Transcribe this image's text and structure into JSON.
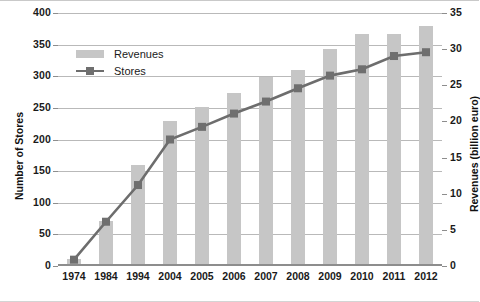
{
  "chart_data": {
    "type": "bar",
    "title": "",
    "subtitle": "",
    "categories": [
      "1974",
      "1984",
      "1994",
      "2004",
      "2005",
      "2006",
      "2007",
      "2008",
      "2009",
      "2010",
      "2011",
      "2012"
    ],
    "xlabel": "",
    "legend_position": "top-left",
    "grid": true,
    "series": [
      {
        "name": "Revenues",
        "type": "bar",
        "axis": "right",
        "unit": "billion euro",
        "color": "#c6c6c6",
        "values": [
          1.0,
          6.2,
          14.0,
          20.1,
          22.0,
          24.0,
          26.1,
          27.1,
          30.0,
          32.1,
          32.1,
          33.2
        ]
      },
      {
        "name": "Stores",
        "type": "line",
        "axis": "left",
        "unit": "stores",
        "color": "#6d6d6d",
        "values": [
          10,
          70,
          128,
          200,
          220,
          241,
          260,
          281,
          301,
          311,
          332,
          338
        ]
      }
    ],
    "left_axis": {
      "label": "Number of Stores",
      "min": 0,
      "max": 400,
      "ticks": [
        "0",
        "50",
        "100",
        "150",
        "200",
        "250",
        "300",
        "350",
        "400"
      ],
      "tick_values": [
        0,
        50,
        100,
        150,
        200,
        250,
        300,
        350,
        400
      ]
    },
    "right_axis": {
      "label": "Revenues (billion euro)",
      "min": 0,
      "max": 35,
      "ticks": [
        "0",
        "5",
        "10",
        "15",
        "20",
        "25",
        "30",
        "35"
      ],
      "tick_values": [
        0,
        5,
        10,
        15,
        20,
        25,
        30,
        35
      ]
    },
    "legend": [
      {
        "label": "Revenues",
        "marker": "bar-swatch",
        "color": "#c6c6c6"
      },
      {
        "label": "Stores",
        "marker": "line-square",
        "color": "#6d6d6d"
      }
    ]
  }
}
